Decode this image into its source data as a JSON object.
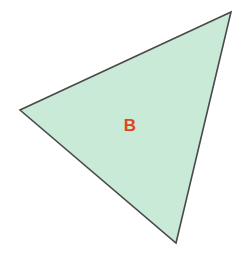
{
  "canvas": {
    "width": 242,
    "height": 259,
    "background_color": "#ffffff"
  },
  "figure": {
    "kind": "triangle",
    "label": "B",
    "label_color": "#e04422",
    "label_position": {
      "x": 130,
      "y": 125
    },
    "fill_color": "#c8ead6",
    "stroke_color": "#4a4a4a",
    "stroke_width": 1.6,
    "vertices": [
      {
        "name": "top-right-vertex",
        "x": 231,
        "y": 12
      },
      {
        "name": "left-vertex",
        "x": 20,
        "y": 110
      },
      {
        "name": "bottom-vertex",
        "x": 176,
        "y": 243
      }
    ],
    "points_attr": "231,12 20,110 176,243"
  }
}
